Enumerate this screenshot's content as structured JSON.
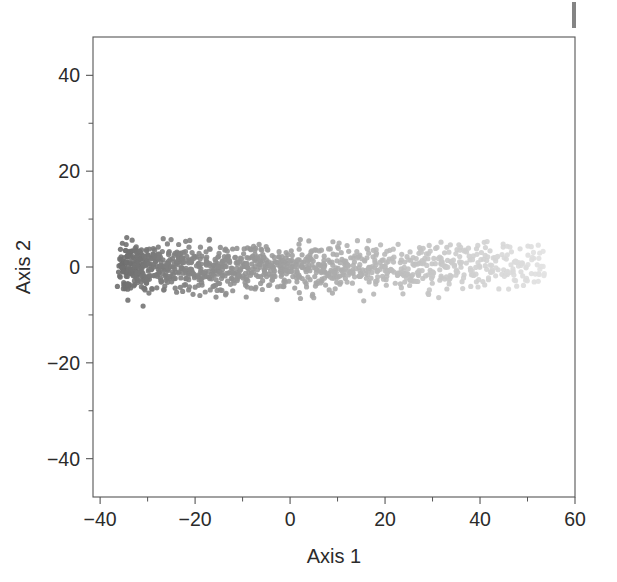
{
  "figure": {
    "background": "#ffffff",
    "frame_color": "#555555",
    "text_color": "#2b2b2b",
    "scan_artifact": {
      "name": "page-edge-mark",
      "color": "#6f6f6f"
    }
  },
  "chart_data": {
    "type": "scatter",
    "title": "",
    "xlabel": "Axis 1",
    "ylabel": "Axis 2",
    "xlim": [
      -41.5,
      60
    ],
    "ylim": [
      -48,
      48
    ],
    "xticks": [
      -40,
      -20,
      0,
      20,
      40,
      60
    ],
    "xticklabels": [
      "-40",
      "-20",
      "0",
      "20",
      "40",
      "60"
    ],
    "yticks": [
      40,
      20,
      0,
      -20,
      -40
    ],
    "yticklabels": [
      "40",
      "20",
      "0",
      "-20",
      "-40"
    ],
    "minor_ticks_per_interval": 1,
    "grid": false,
    "legend": null,
    "marker": {
      "shape": "circle",
      "size_px": 5.2,
      "opacity": 0.9
    },
    "colormap": {
      "type": "linear-gradient-by-x",
      "from": "#6e6e6e",
      "to": "#e2e2e2",
      "description": "Point grey level lightens monotonically with increasing Axis 1 value"
    },
    "data_extent": {
      "x_min": -36.2,
      "x_max": 53.8,
      "y_min": -9.6,
      "y_max": 9.4
    },
    "n_points": 780,
    "band": {
      "description": "Dense horizontal band of points centred near Axis 2 = 0, spanning roughly -9 to +9 on Axis 2 and -36 to +54 on Axis 1; density highest at the left (dark) end and thinning toward the right (light) end."
    },
    "series": [
      {
        "name": "ordination-scores",
        "x": [
          -36.2,
          -35.8,
          -35.6,
          -35.5,
          -35.4,
          -35.3,
          -35.2,
          -35.1,
          -35.0,
          -34.9,
          -34.8,
          -34.7,
          -34.6,
          -34.6,
          -34.5,
          -34.4,
          -34.3,
          -34.2,
          -34.1,
          -34.0,
          -33.9,
          -33.8,
          -33.7,
          -33.6,
          -33.5,
          -33.4,
          -33.3,
          -33.2,
          -33.1,
          -33.0,
          -32.9,
          -32.8,
          -32.7,
          -32.6,
          -32.5,
          -32.4,
          -32.3,
          -32.2,
          -32.1,
          -32.0,
          -31.9,
          -31.8,
          -31.7,
          -31.6,
          -31.5,
          -31.4,
          -31.3,
          -31.2,
          -31.1,
          -31.0,
          -30.9,
          -30.8,
          -30.7,
          -30.6,
          -30.5,
          -30.4,
          -30.3,
          -30.2,
          -30.1,
          -30.0,
          -29.8,
          -29.6,
          -29.5,
          -29.4,
          -29.2,
          -29.0,
          -28.9,
          -28.8,
          -28.6,
          -28.5,
          -28.3,
          -28.2,
          -28.0,
          -27.9,
          -27.7,
          -27.6,
          -27.4,
          -27.3,
          -27.1,
          -27.0,
          -26.8,
          -26.7,
          -26.5,
          -26.4,
          -26.2,
          -26.1,
          -25.9,
          -25.8,
          -25.6,
          -25.5,
          -25.3,
          -25.2,
          -25.0,
          -24.8,
          -24.7,
          -24.5,
          -24.4,
          -24.2,
          -24.1,
          -23.9,
          -23.8,
          -23.6,
          -23.5,
          -23.3,
          -23.2,
          -23.0,
          -22.9,
          -22.7,
          -22.6,
          -22.4,
          -22.3,
          -22.1,
          -22.0,
          -21.8,
          -21.6,
          -21.5,
          -21.3,
          -21.2,
          -21.0,
          -20.9,
          -20.7,
          -20.6,
          -20.4,
          -20.3,
          -20.1,
          -20.0,
          -19.8,
          -19.6,
          -19.5,
          -19.3,
          -19.2,
          -19.0,
          -18.9,
          -18.7,
          -18.6,
          -18.4,
          -18.3,
          -18.1,
          -18.0,
          -17.8,
          -17.6,
          -17.5,
          -17.3,
          -17.2,
          -17.0,
          -16.9,
          -16.7,
          -16.6,
          -16.4,
          -16.3,
          -16.1,
          -16.0,
          -15.8,
          -15.6,
          -15.5,
          -15.3,
          -15.2,
          -15.0,
          -14.9,
          -14.7,
          -14.6,
          -14.4,
          -14.3,
          -14.1,
          -14.0,
          -13.8,
          -13.6,
          -13.5,
          -13.3,
          -13.2,
          -13.0,
          -12.9,
          -12.7,
          -12.6,
          -12.4,
          -12.3,
          -12.1,
          -12.0,
          -11.8,
          -11.6,
          -11.5,
          -11.3,
          -11.2,
          -11.0,
          -10.9,
          -10.7,
          -10.6,
          -10.4,
          -10.3,
          -10.1,
          -10.0,
          -9.8,
          -9.6,
          -9.5,
          -9.3,
          -9.2,
          -9.0,
          -8.9,
          -8.7,
          -8.6,
          -8.4,
          -8.3,
          -8.1,
          -8.0,
          -7.8,
          -7.6,
          -7.5,
          -7.3,
          -7.2,
          -7.0,
          -6.9,
          -6.7,
          -6.6,
          -6.4,
          -6.3,
          -6.1,
          -6.0,
          -5.8,
          -5.6,
          -5.5,
          -5.3,
          -5.2,
          -5.0,
          -4.9,
          -4.7,
          -4.6,
          -4.4,
          -4.3,
          -4.1,
          -4.0,
          -3.8,
          -3.6,
          -3.5,
          -3.3,
          -3.2,
          -3.0,
          -2.9,
          -2.7,
          -2.6,
          -2.4,
          -2.3,
          -2.1,
          -2.0,
          -1.8,
          -1.6,
          -1.5,
          -1.3,
          -1.2,
          -1.0,
          -0.9,
          -0.7,
          -0.6,
          -0.4,
          -0.3,
          -0.1,
          0.0,
          0.2,
          0.4,
          0.5,
          0.7,
          0.8,
          1.0,
          1.1,
          1.3,
          1.4,
          1.6,
          1.7,
          1.9,
          2.0,
          2.2,
          2.4,
          2.5,
          2.7,
          2.8,
          3.0,
          3.1,
          3.3,
          3.4,
          3.6,
          3.7,
          3.9,
          4.0,
          4.2,
          4.4,
          4.5,
          4.7,
          4.8,
          5.0,
          5.1,
          5.3,
          5.4,
          5.6,
          5.7,
          5.9,
          6.0,
          6.2,
          6.4,
          6.5,
          6.7,
          6.8,
          7.0,
          7.1,
          7.3,
          7.4,
          7.6,
          7.7,
          7.9,
          8.0,
          8.2,
          8.4,
          8.5,
          8.7,
          8.8,
          9.0,
          9.1,
          9.3,
          9.4,
          9.6,
          9.7,
          9.9,
          10.0,
          10.2,
          10.4,
          10.5,
          10.7,
          10.8,
          11.0,
          11.1,
          11.3,
          11.4,
          11.6,
          11.7,
          11.9,
          12.0,
          12.2,
          12.4,
          12.5,
          12.7,
          12.8,
          13.0,
          13.1,
          13.3,
          13.4,
          13.6,
          13.7,
          13.9,
          14.0,
          14.2,
          14.4,
          14.5,
          14.7,
          14.8,
          15.0,
          15.1,
          15.3,
          15.4,
          15.6,
          15.7,
          15.9,
          16.0,
          16.2,
          16.4,
          16.5,
          16.7,
          16.8,
          17.0,
          17.1,
          17.3,
          17.4,
          17.6,
          17.7,
          17.9,
          18.0,
          18.2,
          18.4,
          18.5,
          18.7,
          18.8,
          19.0,
          19.1,
          19.3,
          19.4,
          19.6,
          19.7,
          19.9,
          20.0,
          20.2,
          20.4,
          20.5,
          20.7,
          20.8,
          21.0,
          21.1,
          21.3,
          21.4,
          21.6,
          21.7,
          21.9,
          22.0,
          22.2,
          22.4,
          22.5,
          22.7,
          22.8,
          23.0,
          23.1,
          23.3,
          23.4,
          23.6,
          23.7,
          23.9,
          24.0,
          24.2,
          24.4,
          24.5,
          24.7,
          24.8,
          25.0,
          25.1,
          25.3,
          25.4,
          25.6,
          25.7,
          25.9,
          26.0,
          26.2,
          26.4,
          26.5,
          26.7,
          26.8,
          27.0,
          27.1,
          27.3,
          27.4,
          27.6,
          27.7,
          27.9,
          28.0,
          28.2,
          28.4,
          28.5,
          28.7,
          28.8,
          29.0,
          29.1,
          29.3,
          29.4,
          29.6,
          29.7,
          29.9,
          30.0,
          30.2,
          30.4,
          30.5,
          30.7,
          30.8,
          31.0,
          31.1,
          31.3,
          31.4,
          31.6,
          31.7,
          31.9,
          32.0,
          32.2,
          32.4,
          32.5,
          32.7,
          32.8,
          33.0,
          33.1,
          33.3,
          33.4,
          33.6,
          33.7,
          33.9,
          34.0,
          34.2,
          34.4,
          34.5,
          34.7,
          34.8,
          35.0,
          35.1,
          35.3,
          35.4,
          35.6,
          35.7,
          35.9,
          36.0,
          36.2,
          36.4,
          36.5,
          36.7,
          36.8,
          37.0,
          37.1,
          37.3,
          37.4,
          37.6,
          37.7,
          37.9,
          38.0,
          38.2,
          38.4,
          38.5,
          38.7,
          38.8,
          39.0,
          39.1,
          39.3,
          39.4,
          39.6,
          39.7,
          39.9,
          40.0,
          40.2,
          40.4,
          40.5,
          40.7,
          40.8,
          41.0,
          41.1,
          41.3,
          41.4,
          41.6,
          41.7,
          41.9,
          42.0,
          42.2,
          42.4,
          42.5,
          42.7,
          42.8,
          43.0,
          43.1,
          43.3,
          43.4,
          43.6,
          43.7,
          43.9,
          44.0,
          44.2,
          44.4,
          44.5,
          44.7,
          44.8,
          45.0,
          45.1,
          45.3,
          45.4,
          45.6,
          45.7,
          45.9,
          46.0,
          46.2,
          46.4,
          46.5,
          46.7,
          46.8,
          47.0,
          47.1,
          47.3,
          47.4,
          47.6,
          47.7,
          47.9,
          48.0,
          48.2,
          48.4,
          48.5,
          48.7,
          48.8,
          49.0,
          49.1,
          49.3,
          49.4,
          49.6,
          49.7,
          49.9,
          50.0,
          50.2,
          50.4,
          50.5,
          50.7,
          50.8,
          51.0,
          51.1,
          51.3,
          51.4,
          51.6,
          51.7,
          51.9,
          52.0,
          52.2,
          52.4,
          52.5,
          52.7,
          52.8,
          53.0,
          53.1,
          53.3,
          53.4,
          53.6,
          53.8
        ],
        "y_band_half_width": 9.2
      }
    ]
  },
  "axes": {
    "x_label": "Axis 1",
    "y_label": "Axis 2"
  }
}
